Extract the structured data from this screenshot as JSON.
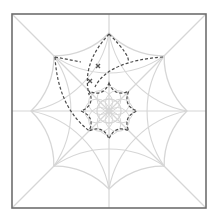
{
  "diagram": {
    "title": "",
    "frame": {
      "x": 12,
      "y": 14,
      "width": 194,
      "height": 194,
      "stroke": "#6e6e6e"
    },
    "center": {
      "x": 109,
      "y": 111
    },
    "colors": {
      "guide": "#d6d6d6",
      "dashed": "#4a4a4a",
      "marker": "#555555"
    },
    "guide_star": {
      "points": 8,
      "outer_radius": 78,
      "inner_radius": 38,
      "curved_sides": true
    },
    "inner_rosette": {
      "radius": 12
    },
    "dashed_star": {
      "points": 8,
      "outer_radius": 28,
      "inner_radius": 21
    },
    "dashed_petals": [
      {
        "name": "top-petal",
        "tip": [
          109,
          34
        ]
      },
      {
        "name": "left-petal",
        "tip": [
          55,
          57
        ]
      },
      {
        "name": "right-petal",
        "tip": [
          163,
          57
        ]
      }
    ],
    "markers": [
      {
        "type": "x",
        "x": 98,
        "y": 66
      },
      {
        "type": "x",
        "x": 90,
        "y": 81
      }
    ]
  }
}
